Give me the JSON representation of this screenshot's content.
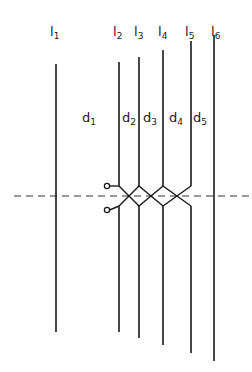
{
  "diagram": {
    "line_color": "#1a1a1a",
    "dash_color": "#333333",
    "lines": [
      {
        "id": "l1",
        "base": "l",
        "sub": "1",
        "x": 56,
        "top": 64,
        "bottom": 332,
        "label_x": 50,
        "label_y": 25
      },
      {
        "id": "l2",
        "base": "l",
        "sub": "2",
        "x": 119,
        "top": 62,
        "bottom": 332,
        "label_x": 113,
        "label_y": 25
      },
      {
        "id": "l3",
        "base": "l",
        "sub": "3",
        "x": 139,
        "top": 57,
        "bottom": 338,
        "label_x": 134,
        "label_y": 25
      },
      {
        "id": "l4",
        "base": "l",
        "sub": "4",
        "x": 163,
        "top": 50,
        "bottom": 345,
        "label_x": 158,
        "label_y": 25
      },
      {
        "id": "l5",
        "base": "l",
        "sub": "5",
        "x": 191,
        "top": 41,
        "bottom": 353,
        "label_x": 185,
        "label_y": 25
      },
      {
        "id": "l6",
        "base": "l",
        "sub": "6",
        "x": 214,
        "top": 35,
        "bottom": 361,
        "label_x": 211,
        "label_y": 25
      }
    ],
    "gaps": [
      {
        "id": "d1",
        "base": "d",
        "sub": "1",
        "label_x": 82,
        "label_y": 111
      },
      {
        "id": "d2",
        "base": "d",
        "sub": "2",
        "label_x": 122,
        "label_y": 111
      },
      {
        "id": "d3",
        "base": "d",
        "sub": "3",
        "label_x": 143,
        "label_y": 111
      },
      {
        "id": "d4",
        "base": "d",
        "sub": "4",
        "label_x": 169,
        "label_y": 111
      },
      {
        "id": "d5",
        "base": "d",
        "sub": "5",
        "label_x": 193,
        "label_y": 111
      }
    ],
    "axis": {
      "y": 196,
      "x1": 14,
      "x2": 252,
      "dash": "7,5"
    },
    "junction": {
      "upper_y": 186,
      "lower_y": 206,
      "terminals": [
        {
          "id": "terminal-upper",
          "cx": 107,
          "cy": 186,
          "r": 2.6
        },
        {
          "id": "terminal-lower",
          "cx": 107,
          "cy": 210,
          "r": 2.6
        }
      ]
    }
  }
}
